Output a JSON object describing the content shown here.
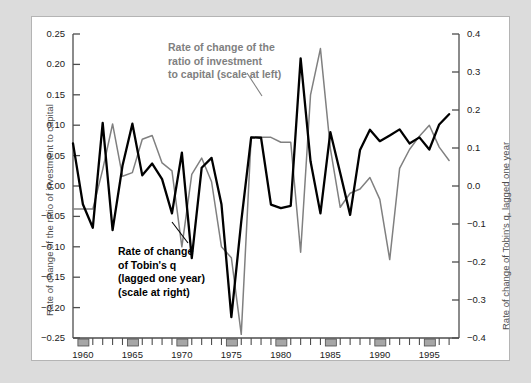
{
  "chart_data": {
    "type": "line",
    "title": "",
    "xlabel": "",
    "ylabel": "Rate of change of the ratio of investment to capital",
    "y2label": "Rate of change of Tobin's q, lagged one year",
    "xlim": [
      1959,
      1998
    ],
    "ylim": [
      -0.25,
      0.25
    ],
    "y2lim": [
      -0.4,
      0.4
    ],
    "grid": false,
    "legend_position": "inline-annotation",
    "x": [
      1959,
      1960,
      1961,
      1962,
      1963,
      1964,
      1965,
      1966,
      1967,
      1968,
      1969,
      1970,
      1971,
      1972,
      1973,
      1974,
      1975,
      1976,
      1977,
      1978,
      1979,
      1980,
      1981,
      1982,
      1983,
      1984,
      1985,
      1986,
      1987,
      1988,
      1989,
      1990,
      1991,
      1992,
      1993,
      1994,
      1995,
      1996,
      1997
    ],
    "series": [
      {
        "name": "Rate of change of the ratio of investment to capital (scale at left)",
        "axis": "left",
        "color": "#808080",
        "values": [
          -0.038,
          -0.038,
          -0.038,
          0.027,
          0.102,
          0.016,
          0.022,
          0.077,
          0.083,
          0.038,
          0.025,
          -0.1,
          0.019,
          0.046,
          0.007,
          -0.1,
          -0.118,
          -0.244,
          0.08,
          0.08,
          0.08,
          0.072,
          0.072,
          -0.109,
          0.15,
          0.226,
          0.062,
          -0.035,
          -0.012,
          -0.005,
          0.014,
          -0.022,
          -0.121,
          0.029,
          0.06,
          0.082,
          0.1,
          0.064,
          0.042
        ]
      },
      {
        "name": "Rate of change of Tobin's q (lagged one year) (scale at right)",
        "axis": "right",
        "color": "#000000",
        "values": [
          0.112,
          -0.048,
          -0.11,
          0.166,
          -0.116,
          0.053,
          0.164,
          0.028,
          0.059,
          0.018,
          -0.072,
          0.088,
          -0.19,
          0.048,
          0.074,
          -0.048,
          -0.345,
          -0.093,
          0.128,
          0.127,
          -0.049,
          -0.058,
          -0.052,
          0.336,
          0.065,
          -0.072,
          0.142,
          0.034,
          -0.076,
          0.095,
          0.148,
          0.118,
          0.133,
          0.149,
          0.112,
          0.128,
          0.096,
          0.162,
          0.189
        ]
      }
    ],
    "yticks_left": [
      "0.25",
      "0.20",
      "0.15",
      "0.10",
      "0.05",
      "0.00",
      "-0.05",
      "-0.10",
      "-0.15",
      "-0.20",
      "-0.25"
    ],
    "yticks_right": [
      "0.4",
      "0.3",
      "0.2",
      "0.1",
      "0.0",
      "-0.1",
      "-0.2",
      "-0.3",
      "-0.4"
    ],
    "xticks": [
      "1960",
      "1965",
      "1970",
      "1975",
      "1980",
      "1985",
      "1990",
      "1995"
    ],
    "xtick_years": [
      1960,
      1965,
      1970,
      1975,
      1980,
      1985,
      1990,
      1995
    ],
    "annotations": [
      {
        "id": "gray",
        "text": "Rate of change of the\nratio of investment\nto capital (scale at left)",
        "line1": "Rate of change of the",
        "line2": "ratio of investment",
        "line3": "to capital (scale at left)",
        "color": "#808080"
      },
      {
        "id": "black",
        "line1": "Rate of change",
        "line2": "of Tobin's q",
        "line3": "(lagged one year)",
        "line4": "(scale at right)",
        "color": "#000000"
      }
    ]
  },
  "figure": {
    "background": "#dcdcdc",
    "panel_background": "#ffffff",
    "border_color": "#b4b4b4",
    "axis_color": "#4d4d4d",
    "tick_block_color": "#a6a6a6"
  }
}
